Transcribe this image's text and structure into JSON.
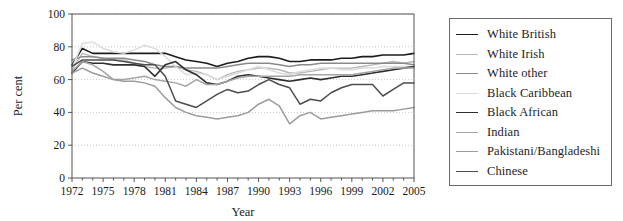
{
  "chart_data": {
    "type": "line",
    "title": "",
    "xlabel": "Year",
    "ylabel": "Per cent",
    "xlim": [
      1972,
      2005
    ],
    "ylim": [
      0,
      100
    ],
    "yticks": [
      0,
      20,
      40,
      60,
      80,
      100
    ],
    "xticks": [
      1972,
      1975,
      1978,
      1981,
      1984,
      1987,
      1990,
      1993,
      1996,
      1999,
      2002,
      2005
    ],
    "grid": "horizontal-dotted",
    "legend_position": "right-outside",
    "x": [
      1972,
      1973,
      1974,
      1975,
      1976,
      1977,
      1978,
      1979,
      1980,
      1981,
      1982,
      1983,
      1984,
      1985,
      1986,
      1987,
      1988,
      1989,
      1990,
      1991,
      1992,
      1993,
      1994,
      1995,
      1996,
      1997,
      1998,
      1999,
      2000,
      2001,
      2002,
      2003,
      2004,
      2005
    ],
    "series": [
      {
        "name": "White British",
        "color": "#1c1c1c",
        "width": 1.6,
        "values": [
          69,
          79,
          76,
          76,
          76,
          76,
          76,
          76,
          76,
          76,
          74,
          72,
          71,
          70,
          68,
          70,
          71,
          73,
          74,
          74,
          73,
          71,
          71,
          72,
          72,
          72,
          73,
          73,
          74,
          74,
          75,
          75,
          75,
          76
        ]
      },
      {
        "name": "White Irish",
        "color": "#b8b8b8",
        "width": 1.4,
        "values": [
          66,
          76,
          74,
          73,
          72,
          72,
          70,
          68,
          67,
          67,
          68,
          66,
          65,
          63,
          60,
          63,
          65,
          66,
          67,
          67,
          66,
          64,
          64,
          65,
          66,
          67,
          67,
          67,
          68,
          69,
          70,
          71,
          70,
          71
        ]
      },
      {
        "name": "White other",
        "color": "#8a8a8a",
        "width": 1.5,
        "values": [
          72,
          74,
          74,
          73,
          73,
          73,
          72,
          71,
          69,
          68,
          68,
          67,
          67,
          67,
          67,
          68,
          69,
          70,
          70,
          70,
          69,
          68,
          69,
          69,
          70,
          70,
          70,
          70,
          70,
          70,
          70,
          70,
          70,
          69
        ]
      },
      {
        "name": "Black Caribbean",
        "color": "#dcdcdc",
        "width": 1.5,
        "values": [
          67,
          82,
          83,
          79,
          77,
          76,
          78,
          81,
          79,
          74,
          68,
          63,
          64,
          63,
          60,
          62,
          64,
          66,
          68,
          66,
          64,
          63,
          65,
          66,
          67,
          67,
          66,
          66,
          67,
          67,
          68,
          68,
          68,
          68
        ]
      },
      {
        "name": "Black African",
        "color": "#2e2e2e",
        "width": 1.6,
        "values": [
          64,
          71,
          70,
          70,
          69,
          69,
          69,
          68,
          62,
          69,
          71,
          66,
          63,
          58,
          57,
          59,
          62,
          63,
          62,
          61,
          60,
          59,
          60,
          61,
          60,
          61,
          62,
          62,
          63,
          64,
          65,
          66,
          67,
          68
        ]
      },
      {
        "name": "Indian",
        "color": "#a5a5a5",
        "width": 1.5,
        "values": [
          65,
          71,
          69,
          65,
          60,
          60,
          61,
          62,
          60,
          59,
          58,
          56,
          60,
          57,
          57,
          59,
          61,
          62,
          62,
          62,
          62,
          62,
          63,
          63,
          63,
          63,
          63,
          63,
          64,
          65,
          66,
          67,
          67,
          67
        ]
      },
      {
        "name": "Pakistani/Bangladeshi",
        "color": "#9c9c9c",
        "width": 1.5,
        "values": [
          64,
          67,
          64,
          62,
          60,
          59,
          59,
          58,
          56,
          49,
          43,
          40,
          38,
          37,
          36,
          37,
          38,
          40,
          45,
          48,
          44,
          33,
          38,
          40,
          36,
          37,
          38,
          39,
          40,
          41,
          41,
          41,
          42,
          43
        ]
      },
      {
        "name": "Chinese",
        "color": "#4d4d4d",
        "width": 1.5,
        "values": [
          68,
          72,
          72,
          72,
          72,
          71,
          70,
          69,
          69,
          62,
          47,
          45,
          43,
          47,
          51,
          54,
          52,
          53,
          57,
          60,
          57,
          55,
          45,
          48,
          47,
          52,
          55,
          57,
          57,
          57,
          50,
          54,
          58,
          58
        ]
      }
    ]
  },
  "legend": {
    "items": [
      {
        "label": "White British"
      },
      {
        "label": "White Irish"
      },
      {
        "label": "White other"
      },
      {
        "label": "Black Caribbean"
      },
      {
        "label": "Black African"
      },
      {
        "label": "Indian"
      },
      {
        "label": "Pakistani/Bangladeshi"
      },
      {
        "label": "Chinese"
      }
    ]
  }
}
